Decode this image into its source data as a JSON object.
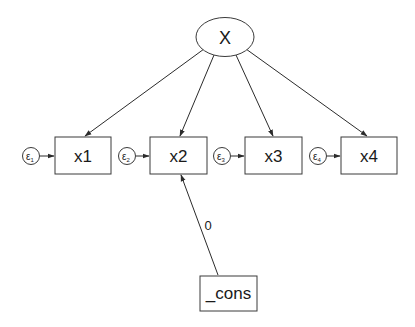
{
  "diagram": {
    "type": "structural-equation-model",
    "latent": {
      "id": "X",
      "label": "X"
    },
    "observed": [
      {
        "id": "x1",
        "label": "x1",
        "error": "ε1",
        "error_base": "ε",
        "error_sub": "1"
      },
      {
        "id": "x2",
        "label": "x2",
        "error": "ε2",
        "error_base": "ε",
        "error_sub": "2"
      },
      {
        "id": "x3",
        "label": "x3",
        "error": "ε3",
        "error_base": "ε",
        "error_sub": "3"
      },
      {
        "id": "x4",
        "label": "x4",
        "error": "ε4",
        "error_base": "ε",
        "error_sub": "4"
      }
    ],
    "constant": {
      "id": "_cons",
      "label": "_cons"
    },
    "paths": [
      {
        "from": "X",
        "to": "x1"
      },
      {
        "from": "X",
        "to": "x2"
      },
      {
        "from": "X",
        "to": "x3"
      },
      {
        "from": "X",
        "to": "x4"
      },
      {
        "from": "ε1",
        "to": "x1"
      },
      {
        "from": "ε2",
        "to": "x2"
      },
      {
        "from": "ε3",
        "to": "x3"
      },
      {
        "from": "ε4",
        "to": "x4"
      },
      {
        "from": "_cons",
        "to": "x2",
        "label": "0"
      }
    ],
    "cons_path_label": "0"
  }
}
